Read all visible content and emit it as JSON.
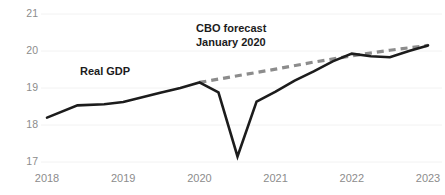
{
  "chart_data": {
    "type": "line",
    "title": "",
    "subtitle": "",
    "xlabel": "",
    "ylabel": "",
    "xlim": [
      2018.0,
      2023.0
    ],
    "ylim": [
      17,
      21
    ],
    "yticks": [
      17,
      18,
      19,
      20,
      21
    ],
    "ytick_labels": [
      "17",
      "18",
      "19",
      "20",
      "21"
    ],
    "xticks": [
      2018,
      2019,
      2020,
      2021,
      2022,
      2023
    ],
    "xtick_labels": [
      "2018",
      "2019",
      "2020",
      "2021",
      "2022",
      "2023"
    ],
    "grid": "horizontal-faint",
    "legend_position": "inline-annotations",
    "series": [
      {
        "name": "Real GDP",
        "style": "solid",
        "color": "#1c1c1c",
        "x": [
          2018.0,
          2018.4,
          2018.75,
          2019.0,
          2019.5,
          2019.75,
          2020.0,
          2020.25,
          2020.5,
          2020.75,
          2021.0,
          2021.25,
          2021.5,
          2021.75,
          2022.0,
          2022.25,
          2022.5,
          2022.75,
          2023.0
        ],
        "values": [
          18.2,
          18.53,
          18.56,
          18.62,
          18.88,
          19.0,
          19.15,
          18.88,
          17.15,
          18.63,
          18.9,
          19.2,
          19.45,
          19.72,
          19.93,
          19.86,
          19.83,
          20.0,
          20.15
        ]
      },
      {
        "name": "CBO forecast January 2020",
        "style": "dashed",
        "color": "#8c8c8c",
        "x": [
          2020.0,
          2020.5,
          2021.0,
          2021.5,
          2022.0,
          2022.5,
          2023.0
        ],
        "values": [
          19.15,
          19.33,
          19.51,
          19.7,
          19.87,
          20.02,
          20.15
        ]
      }
    ],
    "annotations": [
      {
        "name": "cbo-forecast-label",
        "lines": [
          "CBO forecast",
          "January 2020"
        ],
        "x": 2020.5,
        "y": 20.7
      },
      {
        "name": "real-gdp-label",
        "lines": [
          "Real GDP"
        ],
        "x": 2019.1,
        "y": 19.4
      }
    ]
  },
  "axis": {
    "y_labels": [
      "21",
      "20",
      "19",
      "18",
      "17"
    ],
    "x_labels": [
      "2018",
      "2019",
      "2020",
      "2021",
      "2022",
      "2023"
    ]
  },
  "annotations": {
    "forecast_line1": "CBO forecast",
    "forecast_line2": "January 2020",
    "realgdp_label": "Real GDP"
  },
  "colors": {
    "background": "#ffffff",
    "actual_line": "#1c1c1c",
    "forecast_line": "#8c8c8c",
    "tick_text": "#8c8c8c",
    "annotation_text": "#1c1c1c",
    "gridline": "#f2f2f2"
  }
}
